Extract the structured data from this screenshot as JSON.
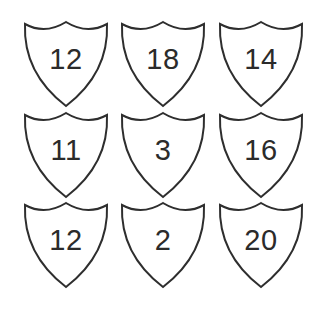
{
  "grid": {
    "rows": 3,
    "columns": 3,
    "stroke_color": "#2e2e2e",
    "text_color": "#2b2b2b",
    "background": "#ffffff"
  },
  "shields": [
    {
      "label": "12",
      "row": 0,
      "col": 0
    },
    {
      "label": "18",
      "row": 0,
      "col": 1
    },
    {
      "label": "14",
      "row": 0,
      "col": 2
    },
    {
      "label": "11",
      "row": 1,
      "col": 0
    },
    {
      "label": "3",
      "row": 1,
      "col": 1
    },
    {
      "label": "16",
      "row": 1,
      "col": 2
    },
    {
      "label": "12",
      "row": 2,
      "col": 0
    },
    {
      "label": "2",
      "row": 2,
      "col": 1
    },
    {
      "label": "20",
      "row": 2,
      "col": 2
    }
  ]
}
